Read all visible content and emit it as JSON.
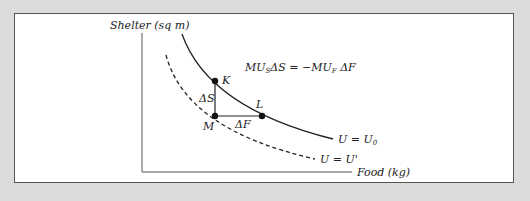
{
  "diagram": {
    "y_axis_label": "Shelter (sq m)",
    "x_axis_label": "Food (kg)",
    "equation": {
      "mu_s": "MU",
      "sub_s": "S",
      "delta_s": "ΔS = −MU",
      "sub_f": "F",
      "delta_f": " ΔF"
    },
    "points": {
      "k": "K",
      "l": "L",
      "m": "M"
    },
    "deltas": {
      "delta_s": "ΔS",
      "delta_f": "ΔF"
    },
    "curves": {
      "solid_label_main": "U = U",
      "solid_label_sub": "0",
      "dashed_label": "U = U'"
    },
    "colors": {
      "background": "#dcdcdc",
      "panel": "#ffffff",
      "ink": "#222222"
    }
  }
}
